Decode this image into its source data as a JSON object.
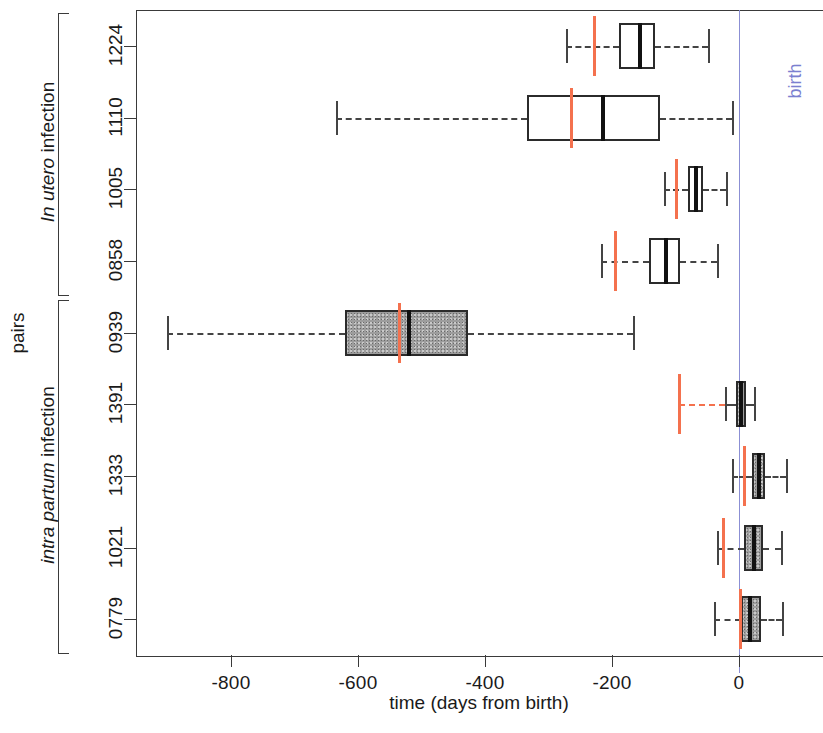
{
  "chart_data": {
    "type": "boxplot",
    "title": "",
    "xlabel": "time (days from birth)",
    "ylabel": "pairs",
    "xlim": [
      -940,
      130
    ],
    "xticks": [
      -800,
      -600,
      -400,
      -200,
      0
    ],
    "xticklabels": [
      "-800",
      "-600",
      "-400",
      "-200",
      "0"
    ],
    "grid": false,
    "reference_line": {
      "label": "birth",
      "x": 0,
      "color": "#8b8fd4"
    },
    "orientation": "horizontal",
    "groups": [
      {
        "name": "In utero infection",
        "name_italic_part": "In utero",
        "name_plain_part": " infection",
        "rows": [
          "1224",
          "1110",
          "1005",
          "0858"
        ]
      },
      {
        "name": "intra partum infection",
        "name_italic_part": "intra partum",
        "name_plain_part": " infection",
        "rows": [
          "0939",
          "1391",
          "1333",
          "1021",
          "0779"
        ]
      }
    ],
    "categories": [
      "1224",
      "1110",
      "1005",
      "0858",
      "0939",
      "1391",
      "1333",
      "1021",
      "0779"
    ],
    "boxes": [
      {
        "label": "1224",
        "group": "In utero infection",
        "whisker_low": -272,
        "q1": -189,
        "median": -156,
        "q3": -132,
        "whisker_high": -49,
        "marker": -228,
        "marker_kind": "line",
        "fill": "white"
      },
      {
        "label": "1110",
        "group": "In utero infection",
        "whisker_low": -635,
        "q1": -334,
        "median": -214,
        "q3": -124,
        "whisker_high": -11,
        "marker": -263,
        "marker_kind": "line",
        "fill": "white"
      },
      {
        "label": "1005",
        "group": "In utero infection",
        "whisker_low": -118,
        "q1": -80,
        "median": -68,
        "q3": -57,
        "whisker_high": -20,
        "marker": -98,
        "marker_kind": "line",
        "fill": "white"
      },
      {
        "label": "0858",
        "group": "In utero infection",
        "whisker_low": -217,
        "q1": -142,
        "median": -115,
        "q3": -93,
        "whisker_high": -35,
        "marker": -194,
        "marker_kind": "line",
        "fill": "white"
      },
      {
        "label": "0939",
        "group": "intra partum infection",
        "whisker_low": -901,
        "q1": -620,
        "median": -520,
        "q3": -427,
        "whisker_high": -167,
        "marker": -534,
        "marker_kind": "line",
        "fill": "gray"
      },
      {
        "label": "1391",
        "group": "intra partum infection",
        "whisker_low": -22,
        "q1": -5,
        "median": 3,
        "q3": 11,
        "whisker_high": 24,
        "marker": -94,
        "marker_kind": "line-dashed",
        "fill": "gray"
      },
      {
        "label": "1333",
        "group": "intra partum infection",
        "whisker_low": -11,
        "q1": 20,
        "median": 31,
        "q3": 41,
        "whisker_high": 74,
        "marker": 9,
        "marker_kind": "line",
        "fill": "gray"
      },
      {
        "label": "1021",
        "group": "intra partum infection",
        "whisker_low": -35,
        "q1": 8,
        "median": 24,
        "q3": 38,
        "whisker_high": 66,
        "marker": -25,
        "marker_kind": "line",
        "fill": "gray"
      },
      {
        "label": "0779",
        "group": "intra partum infection",
        "whisker_low": -39,
        "q1": 3,
        "median": 17,
        "q3": 35,
        "whisker_high": 68,
        "marker": 3,
        "marker_kind": "line",
        "fill": "gray"
      }
    ]
  },
  "axis": {
    "x_label": "time (days from birth)",
    "y_label": "pairs",
    "x_tick_labels": [
      "-800",
      "-600",
      "-400",
      "-200",
      "0"
    ]
  },
  "annotations": {
    "birth": "birth"
  },
  "row_labels": [
    "1224",
    "1110",
    "1005",
    "0858",
    "0939",
    "1391",
    "1333",
    "1021",
    "0779"
  ],
  "group_labels": [
    {
      "italic": "In utero",
      "plain": " infection"
    },
    {
      "italic": "intra partum",
      "plain": " infection"
    }
  ]
}
